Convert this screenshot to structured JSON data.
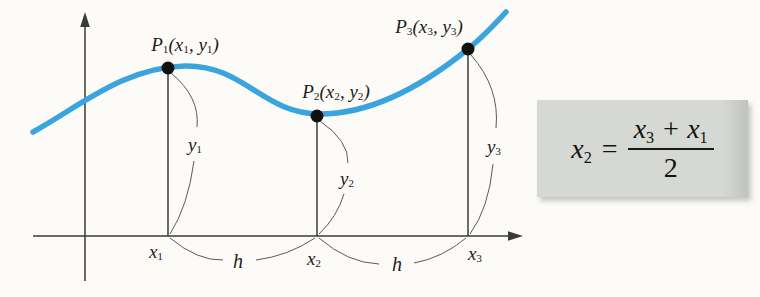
{
  "figure": {
    "background_color": "#fcfbf8",
    "curve_color": "#39a4de",
    "axis_color": "#3a3a3a",
    "leader_color": "#5a5a5a",
    "dot_color": "#111111",
    "points": [
      {
        "name": "P1",
        "label_pieces": [
          {
            "t": "P",
            "sub": "1"
          },
          {
            "t": "(x",
            "sub": "1"
          },
          {
            "t": ", y",
            "sub": "1"
          },
          {
            "t": ")"
          }
        ]
      },
      {
        "name": "P2",
        "label_pieces": [
          {
            "t": "P",
            "sub": "2"
          },
          {
            "t": "(x",
            "sub": "2"
          },
          {
            "t": ", y",
            "sub": "2"
          },
          {
            "t": ")"
          }
        ]
      },
      {
        "name": "P3",
        "label_pieces": [
          {
            "t": "P",
            "sub": "3"
          },
          {
            "t": "(x",
            "sub": "3"
          },
          {
            "t": ", y",
            "sub": "3"
          },
          {
            "t": ")"
          }
        ]
      }
    ],
    "x_axis_labels": [
      [
        {
          "t": "x",
          "sub": "1"
        }
      ],
      [
        {
          "t": "x",
          "sub": "2"
        }
      ],
      [
        {
          "t": "x",
          "sub": "3"
        }
      ]
    ],
    "ordinate_labels": [
      [
        {
          "t": "y",
          "sub": "1"
        }
      ],
      [
        {
          "t": "y",
          "sub": "2"
        }
      ],
      [
        {
          "t": "y",
          "sub": "3"
        }
      ]
    ],
    "spacing_labels": [
      "h",
      "h"
    ]
  },
  "formula": {
    "box_color": "#d6d9d3",
    "lhs_pieces": [
      {
        "t": "x",
        "sub": "2"
      }
    ],
    "equals": "=",
    "numerator_pieces": [
      {
        "t": "x",
        "sub": "3"
      },
      {
        "t": " + "
      },
      {
        "t": "x",
        "sub": "1"
      }
    ],
    "denominator": "2"
  }
}
